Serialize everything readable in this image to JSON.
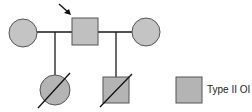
{
  "diagram": {
    "type": "pedigree",
    "colors": {
      "affected_fill": "#b4b4b4",
      "stroke": "#555555",
      "line": "#1a1a1a"
    },
    "individuals": [
      {
        "id": "mother-1",
        "sex": "female",
        "generation": 1,
        "affected": false,
        "deceased": false
      },
      {
        "id": "proband-father",
        "sex": "male",
        "generation": 1,
        "affected": false,
        "deceased": false,
        "proband": true
      },
      {
        "id": "mother-2",
        "sex": "female",
        "generation": 1,
        "affected": false,
        "deceased": false
      },
      {
        "id": "daughter",
        "sex": "female",
        "generation": 2,
        "affected": true,
        "deceased": true
      },
      {
        "id": "son",
        "sex": "male",
        "generation": 2,
        "affected": true,
        "deceased": true
      }
    ],
    "legend": {
      "label": "Type II OI",
      "symbol": "filled-square"
    }
  }
}
